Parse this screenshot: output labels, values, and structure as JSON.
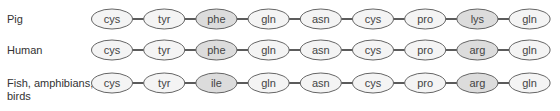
{
  "colors": {
    "ellipse_fill": "#f4f4f4",
    "ellipse_fill_highlight": "#dcdcdc",
    "ellipse_stroke": "#555555",
    "connector": "#333333",
    "text": "#444444"
  },
  "rows": [
    {
      "label": "Pig",
      "residues": [
        "cys",
        "tyr",
        "phe",
        "gln",
        "asn",
        "cys",
        "pro",
        "lys",
        "gln"
      ],
      "highlighted": [
        2,
        7
      ]
    },
    {
      "label": "Human",
      "residues": [
        "cys",
        "tyr",
        "phe",
        "gln",
        "asn",
        "cys",
        "pro",
        "arg",
        "gln"
      ],
      "highlighted": [
        2,
        7
      ]
    },
    {
      "label_line1": "Fish, amphibians,",
      "label_line2": "birds",
      "residues": [
        "cys",
        "tyr",
        "ile",
        "gln",
        "asn",
        "cys",
        "pro",
        "arg",
        "gln"
      ],
      "highlighted": [
        2,
        7
      ]
    }
  ]
}
